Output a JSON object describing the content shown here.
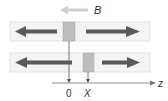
{
  "diagram": {
    "field_label": "B",
    "axis_label": "z",
    "origin_label": "0",
    "position_label": "X",
    "colors": {
      "bar_fill": "#f4f4f4",
      "bar_stroke": "#e2e2e2",
      "arrow": "#5a5a5a",
      "block": "#bdbdbd",
      "field_arrow": "#c8c8c8",
      "axis": "#555555"
    },
    "panels": [
      {
        "name": "top",
        "block_x": 63,
        "left_arrow": "left",
        "right_arrow": "right"
      },
      {
        "name": "bottom",
        "block_x": 83,
        "left_arrow": "left",
        "right_arrow": "right"
      }
    ]
  }
}
